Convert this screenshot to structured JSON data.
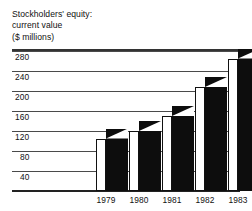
{
  "title": {
    "line1": "Stockholders' equity:",
    "line2": "current value",
    "line3": "($ millions)"
  },
  "chart_data": {
    "type": "bar",
    "title": "Stockholders' equity: current value ($ millions)",
    "xlabel": "",
    "ylabel": "$ millions",
    "categories": [
      "1979",
      "1980",
      "1981",
      "1982",
      "1983"
    ],
    "values": [
      105,
      120,
      150,
      208,
      265
    ],
    "ytick_labels": [
      "280",
      "240",
      "200",
      "160",
      "120",
      "80",
      "40"
    ],
    "ytick_values": [
      280,
      240,
      200,
      160,
      120,
      80,
      40
    ],
    "ylim": [
      0,
      290
    ],
    "grid": true,
    "legend": null,
    "style": "3d-blocks",
    "bar_front_color": "#ffffff",
    "bar_side_color": "#0d0d0d",
    "gridline_color": "#4a4a4a",
    "text_color": "#111111",
    "background_color": "#ffffff"
  }
}
